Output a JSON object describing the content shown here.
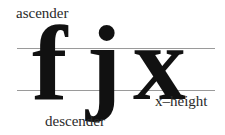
{
  "diagram": {
    "glyphs": [
      {
        "char": "f",
        "role": "ascender-example"
      },
      {
        "char": "j",
        "role": "descender-example"
      },
      {
        "char": "x",
        "role": "x-height-example"
      }
    ],
    "labels": {
      "ascender": "ascender",
      "x_height": "x–height",
      "descender": "descender"
    },
    "guides": {
      "x_height_line": "x-height line",
      "baseline": "baseline"
    },
    "colors": {
      "text": "#111111",
      "guide_lines": "#9a9a9a",
      "background": "#ffffff"
    }
  }
}
